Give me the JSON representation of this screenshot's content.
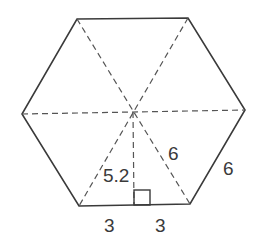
{
  "diagram": {
    "shape": "regular hexagon",
    "labels": {
      "radius": "6",
      "side": "6",
      "apothem": "5.2",
      "half_base_left": "3",
      "half_base_right": "3"
    },
    "colors": {
      "stroke": "#3a3a3a",
      "background": "#ffffff"
    }
  }
}
